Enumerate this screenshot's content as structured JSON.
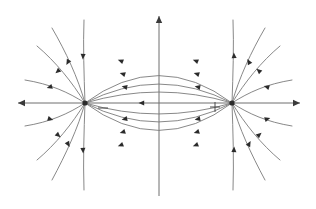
{
  "figure": {
    "type": "field-line-diagram",
    "background_color": "#ffffff",
    "width": 316,
    "height": 209
  },
  "colors": {
    "axis": "#6e6e6e",
    "axis_arrow": "#3a3a3a",
    "field_line": "#7a7a7a",
    "direction_marker": "#2b2b2b",
    "charge": "#2b2b2b",
    "charge_sign": "#4a4a4a"
  },
  "axes": {
    "origin": {
      "x": 159,
      "y": 103
    },
    "x_axis": {
      "label": "",
      "start": {
        "x": 18,
        "y": 103
      },
      "end": {
        "x": 300,
        "y": 103
      },
      "left_arrow": true,
      "right_arrow": true
    },
    "y_axis": {
      "label": "",
      "start": {
        "x": 159,
        "y": 196
      },
      "end": {
        "x": 159,
        "y": 16
      },
      "top_arrow": true,
      "bottom_arrow": false
    }
  },
  "charges": [
    {
      "name": "negative-charge",
      "sign": "−",
      "sign_label": "minus",
      "x": 85,
      "y": 103,
      "sign_offset_x": 18,
      "sign_offset_y": 5,
      "polarity": "negative"
    },
    {
      "name": "positive-charge",
      "sign": "+",
      "sign_label": "plus",
      "x": 232,
      "y": 103,
      "sign_offset_x": -17,
      "sign_offset_y": 4,
      "polarity": "positive"
    }
  ],
  "field_lines": {
    "description": "Field lines run from the positive charge to the negative charge; arrowheads point toward the negative charge.",
    "inner_arc_apex_offsets": [
      55,
      38,
      22
    ],
    "direction": "positive-to-negative",
    "inner_arc_count": 6,
    "outer_line_count": 16,
    "axis_segment_marker_x": 142
  },
  "chart_data": {
    "type": "line",
    "xlabel": "x",
    "ylabel": "y",
    "legend": [],
    "grid": false,
    "annotations": [
      {
        "text": "−",
        "x": 103,
        "y": 108,
        "meaning": "negative charge label"
      },
      {
        "text": "+",
        "x": 215,
        "y": 107,
        "meaning": "positive charge label"
      }
    ],
    "series": [
      {
        "name": "inner-arc-upper-1",
        "path": "M 85 103 Q 159 48 232 103",
        "markers": [
          {
            "x": 121,
            "y": 61,
            "angle": 200
          },
          {
            "x": 196,
            "y": 61,
            "angle": 200
          }
        ]
      },
      {
        "name": "inner-arc-upper-2",
        "path": "M 85 103 Q 159 65 232 103",
        "markers": [
          {
            "x": 123,
            "y": 74,
            "angle": 197
          },
          {
            "x": 197,
            "y": 74,
            "angle": 197
          }
        ]
      },
      {
        "name": "inner-arc-upper-3",
        "path": "M 85 103 Q 159 81 232 103",
        "markers": [
          {
            "x": 125,
            "y": 87,
            "angle": 192
          },
          {
            "x": 198,
            "y": 87,
            "angle": 192
          }
        ]
      },
      {
        "name": "inner-arc-lower-1",
        "path": "M 85 103 Q 159 125 232 103",
        "markers": [
          {
            "x": 125,
            "y": 119,
            "angle": 168
          },
          {
            "x": 198,
            "y": 119,
            "angle": 168
          }
        ]
      },
      {
        "name": "inner-arc-lower-2",
        "path": "M 85 103 Q 159 141 232 103",
        "markers": [
          {
            "x": 123,
            "y": 132,
            "angle": 163
          },
          {
            "x": 197,
            "y": 132,
            "angle": 163
          }
        ]
      },
      {
        "name": "inner-arc-lower-3",
        "path": "M 85 103 Q 159 158 232 103",
        "markers": [
          {
            "x": 121,
            "y": 145,
            "angle": 160
          },
          {
            "x": 196,
            "y": 145,
            "angle": 160
          }
        ]
      },
      {
        "name": "outer-left-up-1",
        "path": "M 85 103 C 78 78 66 52 52 28",
        "markers": [
          {
            "x": 68,
            "y": 62,
            "angle": 119
          }
        ]
      },
      {
        "name": "outer-left-up-2",
        "path": "M 85 103 C 72 82 56 62 37 46",
        "markers": [
          {
            "x": 58,
            "y": 71,
            "angle": 138
          }
        ]
      },
      {
        "name": "outer-left-up-3",
        "path": "M 85 103 C 68 92 50 84 25 80",
        "markers": [
          {
            "x": 50,
            "y": 87,
            "angle": 163
          }
        ]
      },
      {
        "name": "outer-left-up-4",
        "path": "M 85 103 C 84 74 83 46 84 20",
        "markers": [
          {
            "x": 83,
            "y": 56,
            "angle": 93
          }
        ]
      },
      {
        "name": "outer-left-down-1",
        "path": "M 85 103 C 78 128 66 154 52 180",
        "markers": [
          {
            "x": 68,
            "y": 144,
            "angle": 61
          }
        ]
      },
      {
        "name": "outer-left-down-2",
        "path": "M 85 103 C 72 124 56 144 37 160",
        "markers": [
          {
            "x": 58,
            "y": 135,
            "angle": 42
          }
        ]
      },
      {
        "name": "outer-left-down-3",
        "path": "M 85 103 C 68 114 50 122 25 126",
        "markers": [
          {
            "x": 50,
            "y": 119,
            "angle": 17
          }
        ]
      },
      {
        "name": "outer-left-down-4",
        "path": "M 85 103 C 84 132 83 160 84 190",
        "markers": [
          {
            "x": 83,
            "y": 150,
            "angle": 87
          }
        ]
      },
      {
        "name": "outer-right-up-1",
        "path": "M 232 103 C 239 78 251 52 265 28",
        "markers": [
          {
            "x": 249,
            "y": 62,
            "angle": 241
          }
        ]
      },
      {
        "name": "outer-right-up-2",
        "path": "M 232 103 C 245 82 261 62 280 46",
        "markers": [
          {
            "x": 259,
            "y": 71,
            "angle": 222
          }
        ]
      },
      {
        "name": "outer-right-up-3",
        "path": "M 232 103 C 249 92 267 84 292 80",
        "markers": [
          {
            "x": 267,
            "y": 87,
            "angle": 197
          }
        ]
      },
      {
        "name": "outer-right-up-4",
        "path": "M 232 103 C 233 74 234 46 233 20",
        "markers": [
          {
            "x": 234,
            "y": 56,
            "angle": 267
          }
        ]
      },
      {
        "name": "outer-right-down-1",
        "path": "M 232 103 C 239 128 251 154 265 180",
        "markers": [
          {
            "x": 249,
            "y": 144,
            "angle": 299
          }
        ]
      },
      {
        "name": "outer-right-down-2",
        "path": "M 232 103 C 245 124 261 144 280 160",
        "markers": [
          {
            "x": 259,
            "y": 135,
            "angle": 318
          }
        ]
      },
      {
        "name": "outer-right-down-3",
        "path": "M 232 103 C 249 114 267 122 292 126",
        "markers": [
          {
            "x": 267,
            "y": 119,
            "angle": 343
          }
        ]
      },
      {
        "name": "outer-right-down-4",
        "path": "M 232 103 C 233 132 234 160 233 190",
        "markers": [
          {
            "x": 234,
            "y": 150,
            "angle": 273
          }
        ]
      }
    ]
  }
}
